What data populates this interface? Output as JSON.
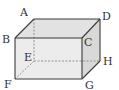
{
  "diagram": {
    "type": "rectangular-cuboid",
    "colors": {
      "edge": "#3a3a3a",
      "hidden_edge": "#8a8a8a",
      "top_face": "#e2e2e2",
      "front_face": "#ececec",
      "side_face": "#d9d9d9"
    },
    "vertices": {
      "A": {
        "label": "A",
        "x": 34,
        "y": 19
      },
      "B": {
        "label": "B",
        "x": 15,
        "y": 38
      },
      "C": {
        "label": "C",
        "x": 82,
        "y": 38
      },
      "D": {
        "label": "D",
        "x": 100,
        "y": 19
      },
      "E": {
        "label": "E",
        "x": 34,
        "y": 61
      },
      "F": {
        "label": "F",
        "x": 15,
        "y": 79
      },
      "G": {
        "label": "G",
        "x": 82,
        "y": 79
      },
      "H": {
        "label": "H",
        "x": 100,
        "y": 61
      }
    },
    "visible_edges": [
      "AB",
      "AD",
      "BC",
      "CD",
      "BF",
      "CG",
      "DH",
      "FG",
      "GH"
    ],
    "hidden_edges": [
      "AE",
      "EF",
      "EH"
    ]
  }
}
